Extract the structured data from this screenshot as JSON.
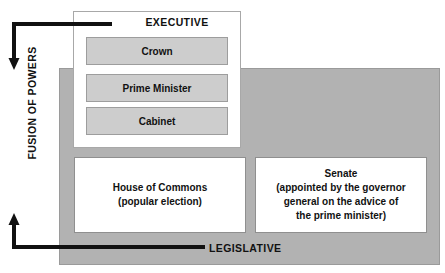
{
  "diagram": {
    "title": "Fusion of Powers",
    "side_label": "FUSION OF POWERS",
    "executive": {
      "label": "EXECUTIVE",
      "organs": [
        {
          "name": "Crown"
        },
        {
          "name": "Prime Minister"
        },
        {
          "name": "Cabinet"
        }
      ]
    },
    "legislative": {
      "label": "LEGISLATIVE",
      "chambers": [
        {
          "name": "house-of-commons",
          "lines": [
            "House of Commons",
            "(popular election)"
          ]
        },
        {
          "name": "senate",
          "lines": [
            "Senate",
            "(appointed by the governor",
            "general on the advice of",
            "the prime minister)"
          ]
        }
      ]
    },
    "colors": {
      "panel_gray": "#b2b2b2",
      "organ_gray": "#cdcdcd",
      "arrow_black": "#111111",
      "box_white": "#ffffff",
      "border_gray": "#9a9a9a"
    },
    "arrows": [
      {
        "name": "executive-to-fusion-arrow",
        "direction": "down"
      },
      {
        "name": "legislative-to-fusion-arrow",
        "direction": "up"
      }
    ]
  }
}
